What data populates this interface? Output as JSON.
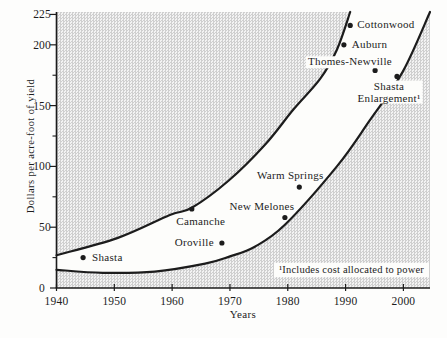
{
  "figure": {
    "footnote": "¹Includes cost allocated to power"
  },
  "chart_data": {
    "type": "scatter",
    "title": "",
    "xlabel": "Years",
    "ylabel": "Dollars per acre-foot of yield",
    "xlim": [
      1940,
      2004.6
    ],
    "ylim": [
      0,
      227
    ],
    "grid": false,
    "legend": "none",
    "x_ticks": [
      1940,
      1950,
      1960,
      1970,
      1980,
      1990,
      2000
    ],
    "y_major_ticks": [
      0,
      50,
      100,
      150,
      200,
      225
    ],
    "y_minor_ticks": [
      25,
      75,
      125,
      175
    ],
    "colors": {
      "ink": "#1c1c1c",
      "band_fill": "#fdfdfb",
      "stipple_dark": "#cfcfcf",
      "stipple_light": "#f3f3f3"
    },
    "band": {
      "name": "cost-trend-band",
      "upper": [
        [
          1940,
          27
        ],
        [
          1950.5,
          41
        ],
        [
          1959.6,
          60
        ],
        [
          1963.4,
          66
        ],
        [
          1969.7,
          88
        ],
        [
          1976.1,
          118
        ],
        [
          1981,
          147
        ],
        [
          1985.6,
          172
        ],
        [
          1988.5,
          196
        ],
        [
          1990.8,
          227
        ]
      ],
      "lower": [
        [
          1940,
          15
        ],
        [
          1948,
          12.5
        ],
        [
          1957,
          13.5
        ],
        [
          1965.7,
          20
        ],
        [
          1970,
          26
        ],
        [
          1974.3,
          34
        ],
        [
          1979.5,
          52
        ],
        [
          1988.5,
          100
        ],
        [
          1994.2,
          138
        ],
        [
          1999.9,
          178
        ],
        [
          2004.6,
          227
        ]
      ]
    },
    "points": [
      {
        "name": "Shasta",
        "year": 1944.6,
        "value": 25,
        "label_align": "start",
        "label_dx": 9,
        "label_dy": 0
      },
      {
        "name": "Camanche",
        "year": 1963.4,
        "value": 65,
        "label_align": "middle",
        "label_dx": 9,
        "label_dy": 13
      },
      {
        "name": "Oroville",
        "year": 1968.6,
        "value": 37,
        "label_align": "end",
        "label_dx": -8,
        "label_dy": 0
      },
      {
        "name": "New Melones",
        "year": 1979.5,
        "value": 58,
        "label_align": "middle",
        "label_dx": -23,
        "label_dy": -10
      },
      {
        "name": "Warm Springs",
        "year": 1982.0,
        "value": 83,
        "label_align": "middle",
        "label_dx": -9,
        "label_dy": -11
      },
      {
        "name": "Thomes-Newville",
        "year": 1995.1,
        "value": 179,
        "label_align": "middle",
        "label_dx": -25,
        "label_dy": -8,
        "halo": true
      },
      {
        "name": "Auburn",
        "year": 1989.7,
        "value": 200,
        "label_align": "start",
        "label_dx": 8,
        "label_dy": 0
      },
      {
        "name": "Cottonwood",
        "year": 1990.8,
        "value": 216,
        "label_align": "start",
        "label_dx": 7,
        "label_dy": 0
      },
      {
        "name": "Shasta Enlargement",
        "year": 1998.9,
        "value": 174,
        "label_lines": [
          "Shasta",
          "Enlargement¹"
        ],
        "label_align": "middle",
        "label_dx": -8,
        "label_dy": 16,
        "halo": true
      }
    ],
    "footnote": "¹Includes cost allocated to power"
  }
}
